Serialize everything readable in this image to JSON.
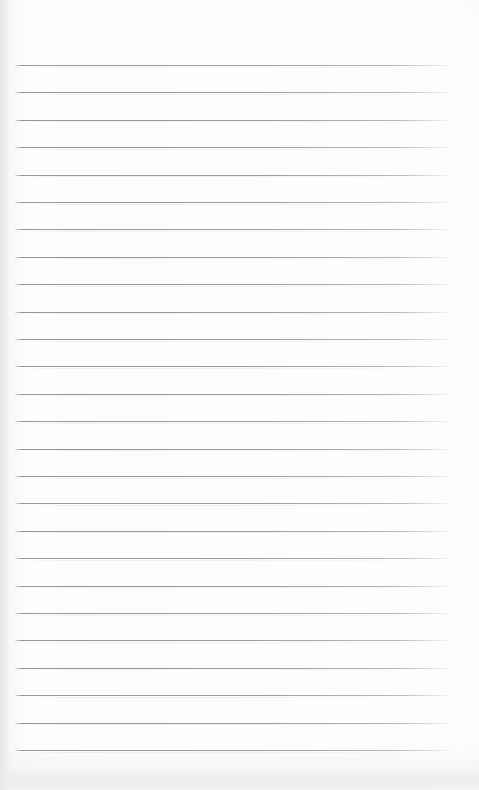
{
  "document": {
    "kind": "ruled-notebook-page",
    "title": "Blank lined notebook page",
    "has_text": false,
    "text_content": "",
    "page_width": 479,
    "page_height": 790
  },
  "paper": {
    "background_color": "#fdfdfd",
    "edge_shadow_color": "#e2e2e6",
    "bottom_shadow_color": "#eaeaee"
  },
  "ruling": {
    "style": "wide-ruled",
    "line_color": "#8e8e95",
    "line_thickness_px": 1,
    "line_count": 26,
    "first_line_y": 65,
    "line_spacing_px": 27.4,
    "line_start_x": 15,
    "line_end_x": 453,
    "lines_y": [
      65,
      92.4,
      119.8,
      147.2,
      174.6,
      202,
      229.4,
      256.8,
      284.2,
      311.6,
      339,
      366.4,
      393.8,
      421.2,
      448.6,
      476,
      503.4,
      530.8,
      558.2,
      585.6,
      613,
      640.4,
      667.8,
      695.2,
      722.6,
      750
    ]
  },
  "margins": {
    "has_vertical_margin_rule": false,
    "top_margin_px": 65,
    "bottom_margin_px": 40,
    "left_margin_px": 15,
    "right_margin_px": 26
  },
  "annotations": {
    "writing": [],
    "notes": []
  }
}
